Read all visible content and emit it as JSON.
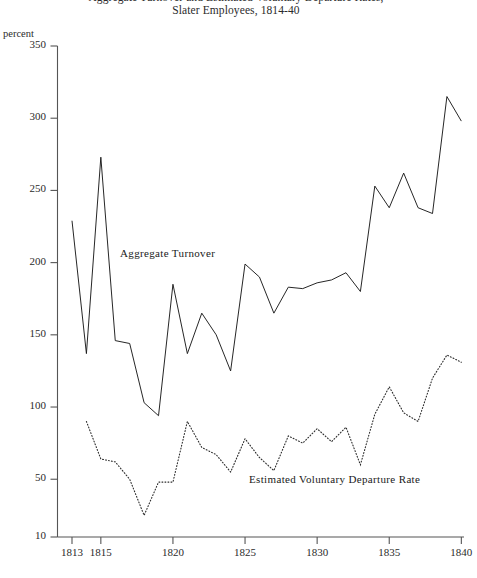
{
  "chart_data": {
    "type": "line",
    "title": "Aggregate Turnover and Estimated Voluntary Departure Rates,",
    "subtitle": "Slater Employees, 1814-40",
    "xlabel": "",
    "ylabel": "percent",
    "xlim": [
      1812.5,
      1840.5
    ],
    "ylim": [
      10,
      350
    ],
    "grid": false,
    "legend_position": "inline-annotation",
    "xticks": [
      1813,
      1815,
      1820,
      1825,
      1830,
      1835,
      1840
    ],
    "xtick_labels": [
      "1813",
      "1815",
      "1820",
      "1825",
      "1830",
      "1835",
      "1840"
    ],
    "yticks": [
      10,
      50,
      100,
      150,
      200,
      250,
      300,
      350
    ],
    "ytick_labels": [
      "10",
      "50",
      "100",
      "150",
      "200",
      "250",
      "300",
      "350"
    ],
    "x": [
      1813,
      1814,
      1815,
      1816,
      1817,
      1818,
      1819,
      1820,
      1821,
      1822,
      1823,
      1824,
      1825,
      1826,
      1827,
      1828,
      1829,
      1830,
      1831,
      1832,
      1833,
      1834,
      1835,
      1836,
      1837,
      1838,
      1839,
      1840
    ],
    "series": [
      {
        "name": "Aggregate Turnover",
        "style": "solid",
        "color": "#1a1a1a",
        "x": [
          1813,
          1814,
          1815,
          1816,
          1817,
          1818,
          1819,
          1820,
          1821,
          1822,
          1823,
          1824,
          1825,
          1826,
          1827,
          1828,
          1829,
          1830,
          1831,
          1832,
          1833,
          1834,
          1835,
          1836,
          1837,
          1838,
          1839,
          1840
        ],
        "values": [
          229,
          137,
          273,
          146,
          144,
          103,
          94,
          185,
          137,
          165,
          150,
          125,
          199,
          190,
          165,
          183,
          182,
          186,
          188,
          193,
          180,
          253,
          238,
          262,
          238,
          234,
          315,
          298
        ]
      },
      {
        "name": "Estimated Voluntary Departure Rate",
        "style": "dotted",
        "color": "#2b2b2b",
        "x": [
          1814,
          1815,
          1816,
          1817,
          1818,
          1819,
          1820,
          1821,
          1822,
          1823,
          1824,
          1825,
          1826,
          1827,
          1828,
          1829,
          1830,
          1831,
          1832,
          1833,
          1834,
          1835,
          1836,
          1837,
          1838,
          1839,
          1840
        ],
        "values": [
          90,
          64,
          62,
          50,
          25,
          48,
          48,
          90,
          72,
          67,
          55,
          78,
          65,
          56,
          80,
          75,
          85,
          76,
          86,
          60,
          95,
          114,
          96,
          90,
          120,
          136,
          131
        ]
      }
    ],
    "annotations": [
      {
        "text": "Aggregate Turnover",
        "x": 1816.6,
        "y": 212
      },
      {
        "text": "Estimated Voluntary Departure Rate",
        "x": 1825.9,
        "y": 48
      }
    ]
  }
}
